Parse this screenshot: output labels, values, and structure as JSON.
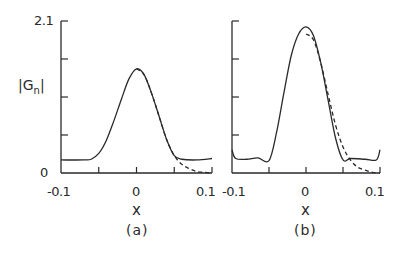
{
  "chart_data": [
    {
      "panel": "(a)",
      "type": "line",
      "title": "",
      "xlabel": "x",
      "ylabel": "|Gn|",
      "xlim": [
        -0.1,
        0.1
      ],
      "ylim": [
        0,
        2.1
      ],
      "x_ticks": [
        -0.1,
        -0.05,
        0,
        0.05,
        0.1
      ],
      "x_tick_labels": [
        "-0.1",
        "0",
        "0.1"
      ],
      "y_ticks": [
        0,
        0.525,
        1.05,
        1.575,
        2.1
      ],
      "y_tick_labels": [
        "0",
        "2.1"
      ],
      "grid": false,
      "series": [
        {
          "name": "solid",
          "style": "solid",
          "x": [
            -0.1,
            -0.07,
            -0.06,
            -0.05,
            -0.04,
            -0.03,
            -0.02,
            -0.01,
            0,
            0.01,
            0.02,
            0.03,
            0.04,
            0.05,
            0.06,
            0.08,
            0.1
          ],
          "y": [
            0.18,
            0.18,
            0.19,
            0.27,
            0.45,
            0.72,
            1.02,
            1.3,
            1.44,
            1.36,
            1.1,
            0.78,
            0.46,
            0.24,
            0.19,
            0.18,
            0.2
          ]
        },
        {
          "name": "dashed",
          "style": "dashed",
          "x": [
            0,
            0.01,
            0.02,
            0.03,
            0.04,
            0.05,
            0.06,
            0.07,
            0.08,
            0.09,
            0.1
          ],
          "y": [
            1.44,
            1.36,
            1.1,
            0.78,
            0.46,
            0.24,
            0.12,
            0.06,
            0.02,
            0.01,
            0.0
          ]
        }
      ]
    },
    {
      "panel": "(b)",
      "type": "line",
      "title": "",
      "xlabel": "x",
      "ylabel": "",
      "xlim": [
        -0.1,
        0.1
      ],
      "ylim": [
        0,
        2.1
      ],
      "x_ticks": [
        -0.1,
        -0.05,
        0,
        0.05,
        0.1
      ],
      "x_tick_labels": [
        "-0.1",
        "0",
        "0.1"
      ],
      "y_ticks": [
        0,
        0.525,
        1.05,
        1.575,
        2.1
      ],
      "grid": false,
      "series": [
        {
          "name": "solid",
          "style": "solid",
          "x": [
            -0.1,
            -0.095,
            -0.08,
            -0.065,
            -0.05,
            -0.04,
            -0.03,
            -0.02,
            -0.01,
            0,
            0.01,
            0.02,
            0.03,
            0.04,
            0.05,
            0.06,
            0.08,
            0.095,
            0.1
          ],
          "y": [
            0.32,
            0.2,
            0.19,
            0.21,
            0.17,
            0.55,
            1.1,
            1.62,
            1.92,
            2.02,
            1.9,
            1.52,
            1.0,
            0.48,
            0.18,
            0.2,
            0.19,
            0.18,
            0.32
          ]
        },
        {
          "name": "dashed",
          "style": "dashed",
          "x": [
            0,
            0.01,
            0.02,
            0.03,
            0.04,
            0.05,
            0.06,
            0.07,
            0.08,
            0.09,
            0.1
          ],
          "y": [
            1.92,
            1.84,
            1.52,
            1.08,
            0.66,
            0.36,
            0.18,
            0.08,
            0.04,
            0.01,
            0.0
          ]
        }
      ]
    }
  ],
  "labels": {
    "ylabel": "|Gn|",
    "ylabel_main": "|G",
    "ylabel_sub": "n",
    "ylabel_end": "|",
    "y_top": "2.1",
    "y_zero": "0",
    "a": {
      "xmin": "-0.1",
      "xmid": "0",
      "xmax": "0.1",
      "xlabel": "x",
      "tag": "(a)"
    },
    "b": {
      "xmin": "-0.1",
      "xmid": "0",
      "xmax": "0.1",
      "xlabel": "x",
      "tag": "(b)"
    }
  },
  "colors": {
    "ink": "#2a2a2a",
    "background": "#ffffff"
  }
}
